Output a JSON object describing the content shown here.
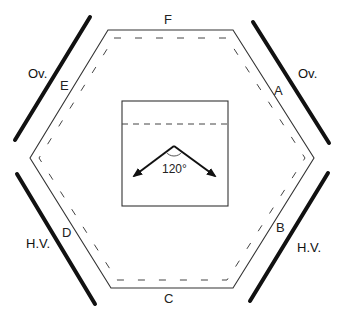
{
  "diagram": {
    "type": "hexagonal-layout",
    "hexagon": {
      "outer_points": [
        [
          108,
          30
        ],
        [
          233,
          30
        ],
        [
          314,
          158
        ],
        [
          233,
          288
        ],
        [
          111,
          288
        ],
        [
          30,
          158
        ]
      ],
      "inner_dashed_points": [
        [
          113,
          37
        ],
        [
          228,
          37
        ],
        [
          305,
          158
        ],
        [
          228,
          281
        ],
        [
          116,
          281
        ],
        [
          38,
          158
        ]
      ]
    },
    "side_labels": {
      "top": "F",
      "upper_left": "E",
      "upper_right": "A",
      "lower_left": "D",
      "lower_right": "B",
      "bottom": "C"
    },
    "outer_bars": [
      {
        "id": "upper-left",
        "label": "Ov.",
        "from": [
          15,
          140
        ],
        "to": [
          90,
          17
        ],
        "label_pos": [
          28,
          77
        ]
      },
      {
        "id": "upper-right",
        "label": "Ov.",
        "from": [
          253,
          22
        ],
        "to": [
          329,
          143
        ],
        "label_pos": [
          298,
          77
        ]
      },
      {
        "id": "lower-left",
        "label": "H.V.",
        "from": [
          17,
          174
        ],
        "to": [
          95,
          304
        ],
        "label_pos": [
          26,
          247
        ]
      },
      {
        "id": "lower-right",
        "label": "H.V.",
        "from": [
          250,
          301
        ],
        "to": [
          328,
          173
        ],
        "label_pos": [
          297,
          251
        ]
      }
    ],
    "inset": {
      "box": {
        "x": 122,
        "y": 101,
        "w": 106,
        "h": 105
      },
      "dashed_line_y": 124,
      "apex": [
        174,
        146
      ],
      "arrow_left_end": [
        133,
        177
      ],
      "arrow_right_end": [
        216,
        177
      ],
      "angle_label": "120°"
    }
  }
}
